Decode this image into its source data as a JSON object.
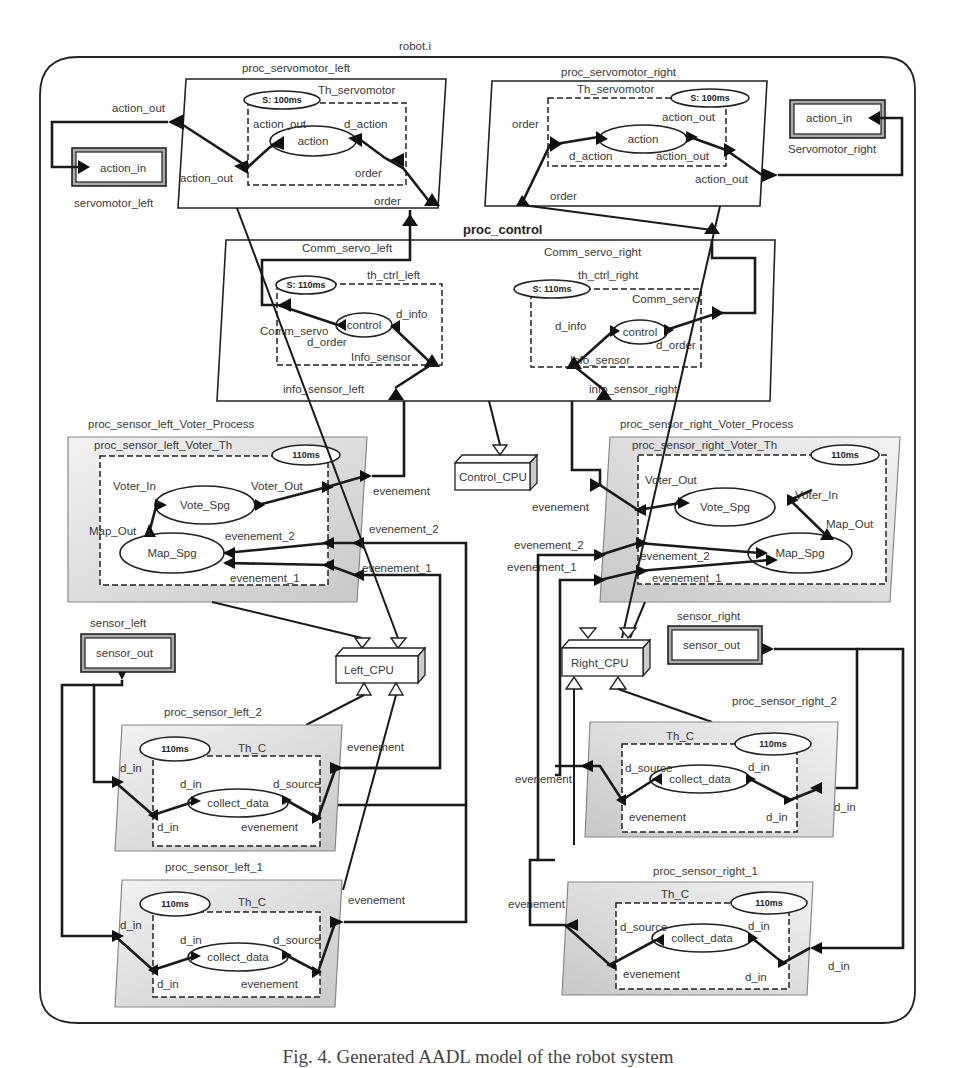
{
  "diagram": {
    "system_name": "robot.i",
    "caption": "Fig. 4. Generated AADL model of the robot system",
    "servo_left_proc": {
      "name": "proc_servomotor_left",
      "thread": "Th_servomotor",
      "period": "S: 100ms",
      "subprogram": "action",
      "ports": {
        "proc_out": "action_out",
        "thr_out": "action_out",
        "sp_out": "action_out",
        "sp_in": "d_action",
        "thr_in": "order",
        "proc_in": "order"
      }
    },
    "servo_left_device": {
      "name": "servomotor_left",
      "port": "action_in"
    },
    "servo_right_proc": {
      "name": "proc_servomotor_right",
      "thread": "Th_servomotor",
      "period": "S: 100ms",
      "subprogram": "action",
      "ports": {
        "thr_in": "order",
        "sp_in": "d_action",
        "sp_out": "action_out",
        "thr_out": "action_out",
        "proc_out": "action_out",
        "proc_in": "order"
      }
    },
    "servo_right_device": {
      "name": "Servomotor_right",
      "port": "action_in"
    },
    "control_proc": {
      "name": "proc_control",
      "port_left_out": "Comm_servo_left",
      "port_right_out": "Comm_servo_right",
      "port_left_in": "info_sensor_left",
      "port_right_in": "info_sensor_right",
      "left_thread": {
        "name": "th_ctrl_left",
        "period": "S: 110ms",
        "subprogram": "control",
        "out": "Comm_servo",
        "sp_out": "d_order",
        "sp_in": "d_info",
        "in": "Info_sensor"
      },
      "right_thread": {
        "name": "th_ctrl_right",
        "period": "S: 110ms",
        "subprogram": "control",
        "out": "Comm_servo",
        "sp_out": "d_order",
        "sp_in": "d_info",
        "in": "Info_sensor"
      }
    },
    "cpus": {
      "control": "Control_CPU",
      "left": "Left_CPU",
      "right": "Right_CPU"
    },
    "voter_left": {
      "process": "proc_sensor_left_Voter_Process",
      "thread": "proc_sensor_left_Voter_Th",
      "period": "110ms",
      "vote_sp": "Vote_Spg",
      "map_sp": "Map_Spg",
      "voter_in": "Voter_In",
      "voter_out": "Voter_Out",
      "map_out": "Map_Out",
      "ev2": "evenement_2",
      "ev1": "evenement_1",
      "proc_out": "evenement",
      "proc_ev2": "evenement_2",
      "proc_ev1": "evenement_1"
    },
    "voter_right": {
      "process": "proc_sensor_right_Voter_Process",
      "thread": "proc_sensor_right_Voter_Th",
      "period": "110ms",
      "vote_sp": "Vote_Spg",
      "map_sp": "Map_Spg",
      "voter_in": "Voter_In",
      "voter_out": "Voter_Out",
      "map_out": "Map_Out",
      "ev2": "evenement_2",
      "ev1": "evenement_1",
      "proc_out": "evenement",
      "proc_ev2": "evenement_2",
      "proc_ev1": "evenement_1"
    },
    "sensor_left_device": {
      "name": "sensor_left",
      "port": "sensor_out"
    },
    "sensor_right_device": {
      "name": "sensor_right",
      "port": "sensor_out"
    },
    "sensor_left_2": {
      "name": "proc_sensor_left_2",
      "thread": "Th_C",
      "period": "110ms",
      "subprogram": "collect_data",
      "proc_in": "d_in",
      "thr_in": "d_in",
      "sp_in": "d_in",
      "sp_out": "d_source",
      "thr_out": "evenement",
      "proc_out": "evenement"
    },
    "sensor_left_1": {
      "name": "proc_sensor_left_1",
      "thread": "Th_C",
      "period": "110ms",
      "subprogram": "collect_data",
      "proc_in": "d_in",
      "thr_in": "d_in",
      "sp_in": "d_in",
      "sp_out": "d_source",
      "thr_out": "evenement",
      "proc_out": "evenement"
    },
    "sensor_right_2": {
      "name": "proc_sensor_right_2",
      "thread": "Th_C",
      "period": "110ms",
      "subprogram": "collect_data",
      "proc_in": "d_in",
      "thr_in": "d_in",
      "sp_in": "d_in",
      "sp_out": "d_source",
      "thr_out": "evenement",
      "proc_out": "evenement"
    },
    "sensor_right_1": {
      "name": "proc_sensor_right_1",
      "thread": "Th_C",
      "period": "110ms",
      "subprogram": "collect_data",
      "proc_in": "d_in",
      "thr_in": "d_in",
      "sp_in": "d_in",
      "sp_out": "d_source",
      "thr_out": "evenement",
      "proc_out": "evenement"
    }
  }
}
